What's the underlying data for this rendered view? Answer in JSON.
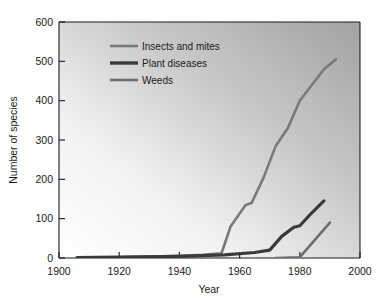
{
  "chart_data": {
    "type": "line",
    "title": "",
    "xlabel": "Year",
    "ylabel": "Number of species",
    "xlim": [
      1900,
      2000
    ],
    "ylim": [
      0,
      600
    ],
    "xticks": [
      1900,
      1920,
      1940,
      1960,
      1980,
      2000
    ],
    "yticks": [
      0,
      100,
      200,
      300,
      400,
      500,
      600
    ],
    "xtick_labels": [
      "1900",
      "1920",
      "1940",
      "1960",
      "1980",
      "2000"
    ],
    "ytick_labels": [
      "0",
      "100",
      "200",
      "300",
      "400",
      "500",
      "600"
    ],
    "grid": false,
    "legend_position": "upper left",
    "series": [
      {
        "name": "Insects and mites",
        "color": "#7a7a7a",
        "width": 2.6,
        "x": [
          1906,
          1920,
          1938,
          1948,
          1954,
          1957,
          1962,
          1964,
          1968,
          1972,
          1976,
          1980,
          1984,
          1988,
          1992
        ],
        "y": [
          1,
          2,
          5,
          8,
          12,
          80,
          135,
          140,
          205,
          285,
          330,
          400,
          440,
          480,
          505
        ]
      },
      {
        "name": "Plant diseases",
        "color": "#3a3a3a",
        "width": 3.2,
        "x": [
          1906,
          1920,
          1940,
          1955,
          1965,
          1970,
          1974,
          1978,
          1980,
          1984,
          1988
        ],
        "y": [
          1,
          2,
          4,
          8,
          14,
          20,
          55,
          78,
          82,
          115,
          145
        ]
      },
      {
        "name": "Weeds",
        "color": "#6e6e6e",
        "width": 2.6,
        "x": [
          1972,
          1980,
          1990
        ],
        "y": [
          0,
          2,
          90
        ]
      }
    ]
  },
  "legend": {
    "entries": [
      {
        "label": "Insects and mites",
        "color": "#7a7a7a",
        "width": 2.6
      },
      {
        "label": "Plant diseases",
        "color": "#3a3a3a",
        "width": 3.4
      },
      {
        "label": "Weeds",
        "color": "#6e6e6e",
        "width": 2.6
      }
    ]
  },
  "axes": {
    "x_label": "Year",
    "y_label": "Number of species"
  },
  "style": {
    "plot_bg_light": "#fefefe",
    "plot_bg_dark": "#a8a8a8",
    "axis_color": "#1a1a1a",
    "page_bg": "#ffffff"
  }
}
